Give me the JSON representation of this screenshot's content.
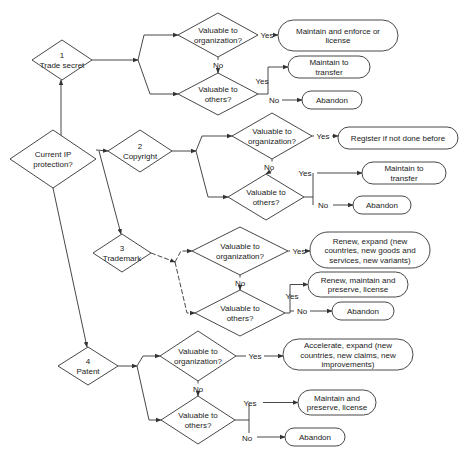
{
  "diagram": {
    "root": {
      "id": "current",
      "lines": [
        "Current IP",
        "protection?"
      ]
    },
    "branches": [
      {
        "id": "trade-secret",
        "lines": [
          "1",
          "Trade secret"
        ],
        "q_org": [
          "Valuable to",
          "organization?"
        ],
        "q_others": [
          "Valuable to",
          "others?"
        ],
        "org_yes": {
          "label": "Yes",
          "outcome": [
            "Maintain and enforce or",
            "license"
          ]
        },
        "org_no": {
          "label": "No"
        },
        "others_yes": {
          "label": "Yes",
          "outcome": [
            "Maintain to",
            "transfer"
          ]
        },
        "others_no": {
          "label": "No",
          "outcome": [
            "Abandon"
          ]
        }
      },
      {
        "id": "copyright",
        "lines": [
          "2",
          "Copyright"
        ],
        "q_org": [
          "Valuable to",
          "organization?"
        ],
        "q_others": [
          "Valuable to",
          "others?"
        ],
        "org_yes": {
          "label": "Yes",
          "outcome": [
            "Register if not done before"
          ]
        },
        "org_no": {
          "label": "No"
        },
        "others_yes": {
          "label": "Yes",
          "outcome": [
            "Maintain to",
            "transfer"
          ]
        },
        "others_no": {
          "label": "No",
          "outcome": [
            "Abandon"
          ]
        }
      },
      {
        "id": "trademark",
        "lines": [
          "3",
          "Trademark"
        ],
        "q_org": [
          "Valuable to",
          "organization?"
        ],
        "q_others": [
          "Valuable to",
          "others?"
        ],
        "org_yes": {
          "label": "Yes",
          "outcome": [
            "Renew, expand (new",
            "countries, new goods and",
            "services, new variants)"
          ]
        },
        "org_no": {
          "label": "No"
        },
        "others_yes": {
          "label": "Yes",
          "outcome": [
            "Renew, maintain and",
            "preserve, license"
          ]
        },
        "others_no": {
          "label": "No",
          "outcome": [
            "Abandon"
          ]
        }
      },
      {
        "id": "patent",
        "lines": [
          "4",
          "Patent"
        ],
        "q_org": [
          "Valuable to",
          "organization?"
        ],
        "q_others": [
          "Valuable to",
          "others?"
        ],
        "org_yes": {
          "label": "Yes",
          "outcome": [
            "Accelerate, expand (new",
            "countries, new claims, new",
            "improvements)"
          ]
        },
        "org_no": {
          "label": "No"
        },
        "others_yes": {
          "label": "Yes",
          "outcome": [
            "Maintain and",
            "preserve, license"
          ]
        },
        "others_no": {
          "label": "No",
          "outcome": [
            "Abandon"
          ]
        }
      }
    ]
  }
}
